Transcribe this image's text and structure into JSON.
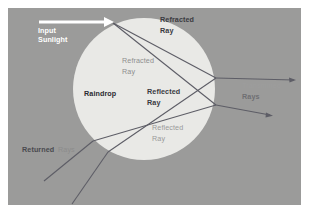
{
  "figure": {
    "background_color": "#9b9b9a",
    "page_color": "#ffffff",
    "raindrop_fill": "#e9e9e6",
    "ray_color": "#5d5d66",
    "arrow_color": "#ffffff",
    "panel": {
      "x": 8,
      "y": 8,
      "width": 293,
      "height": 197
    },
    "raindrop": {
      "cx": 144,
      "cy": 89,
      "r": 71
    }
  },
  "labels": {
    "input_sunlight": {
      "text_line1": "Input",
      "text_line2": "Sunlight",
      "color": "#ffffff",
      "x": 38,
      "y": 33
    },
    "refracted_ray_top": {
      "text_line1": "Refracted",
      "text_line2": "Ray",
      "color": "#3a3a3f",
      "x": 160,
      "y": 22
    },
    "refracted_ray_inner": {
      "text_line1": "Refracted",
      "text_line2": "Ray",
      "color": "#8f8f8f",
      "x": 122,
      "y": 63
    },
    "raindrop": {
      "text": "Raindrop",
      "color": "#2b2b30",
      "x": 84,
      "y": 96
    },
    "reflected_ray_center": {
      "text_line1": "Reflected",
      "text_line2": "Ray",
      "color": "#3a3a3f",
      "x": 147,
      "y": 94
    },
    "reflected_ray_lower": {
      "text_line1": "Reflected",
      "text_line2": "Ray",
      "color": "#9a9a9a",
      "x": 152,
      "y": 130
    },
    "transmitted_rays": {
      "text_line1": "Transmitted",
      "text_line2": "Rays",
      "color": "#9d9d9d",
      "color_line2": "#6f6f73",
      "x": 242,
      "y": 85
    },
    "returned_rays": {
      "text_word1": "Returned",
      "text_word2": "Rays",
      "color": "#4a4a4f",
      "color_word2": "#8c8c8c",
      "x": 22,
      "y": 152
    }
  },
  "rays": [
    {
      "name": "input-sunlight-arrow",
      "kind": "arrow",
      "x1": 39,
      "y1": 22,
      "x2": 112,
      "y2": 22
    },
    {
      "name": "refracted-ray-upper",
      "kind": "line",
      "x1": 113,
      "y1": 23,
      "x2": 216,
      "y2": 78
    },
    {
      "name": "refracted-ray-lower",
      "kind": "line",
      "x1": 113,
      "y1": 23,
      "x2": 216,
      "y2": 105
    },
    {
      "name": "reflected-ray-down-left",
      "kind": "line",
      "x1": 216,
      "y1": 78,
      "x2": 108,
      "y2": 152
    },
    {
      "name": "reflected-ray-down-left-2",
      "kind": "line",
      "x1": 216,
      "y1": 105,
      "x2": 93,
      "y2": 141
    },
    {
      "name": "transmitted-ray-upper",
      "kind": "arrow",
      "x1": 216,
      "y1": 78,
      "x2": 296,
      "y2": 80
    },
    {
      "name": "transmitted-ray-lower",
      "kind": "arrow",
      "x1": 216,
      "y1": 105,
      "x2": 272,
      "y2": 115
    },
    {
      "name": "returned-ray-upper",
      "kind": "line",
      "x1": 93,
      "y1": 141,
      "x2": 44,
      "y2": 181
    },
    {
      "name": "returned-ray-lower",
      "kind": "line",
      "x1": 108,
      "y1": 152,
      "x2": 72,
      "y2": 204
    }
  ]
}
